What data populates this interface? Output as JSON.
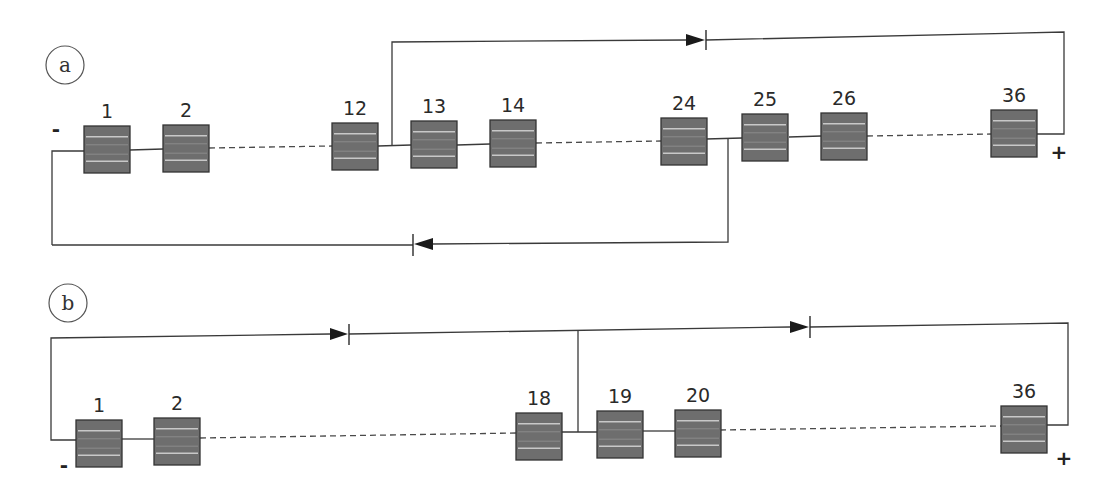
{
  "figure": {
    "panels": [
      {
        "id": "a",
        "label": "a",
        "negative_terminal": "-",
        "positive_terminal": "+",
        "cells": [
          {
            "label": "1"
          },
          {
            "label": "2"
          },
          {
            "label": "12"
          },
          {
            "label": "13"
          },
          {
            "label": "14"
          },
          {
            "label": "24"
          },
          {
            "label": "25"
          },
          {
            "label": "26"
          },
          {
            "label": "36"
          }
        ],
        "elided_ranges": [
          "2-12",
          "14-24",
          "26-36"
        ],
        "bypass_diodes": [
          {
            "from_after_cell": "12",
            "to": "+",
            "direction": "right"
          },
          {
            "from_after_cell": "24",
            "to": "-",
            "direction": "left"
          }
        ]
      },
      {
        "id": "b",
        "label": "b",
        "negative_terminal": "-",
        "positive_terminal": "+",
        "cells": [
          {
            "label": "1"
          },
          {
            "label": "2"
          },
          {
            "label": "18"
          },
          {
            "label": "19"
          },
          {
            "label": "20"
          },
          {
            "label": "36"
          }
        ],
        "elided_ranges": [
          "2-18",
          "20-36"
        ],
        "bypass_diodes": [
          {
            "from": "-",
            "to_after_cell": "18",
            "direction": "right"
          },
          {
            "from_after_cell": "18",
            "to": "+",
            "direction": "right"
          }
        ]
      }
    ]
  },
  "icons": {
    "cell": "solar-cell-icon",
    "diode": "diode-icon"
  },
  "colors": {
    "cell_fill": "#6e6e6e",
    "cell_stripe": "#c8c8c8",
    "wire": "#3a3a3a",
    "background": "#ffffff"
  }
}
